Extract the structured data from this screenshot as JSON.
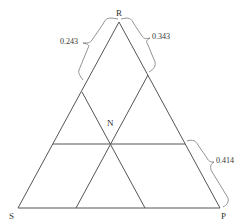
{
  "diagram": {
    "type": "ternary-triangle",
    "vertices": {
      "top": "R",
      "bottom_left": "S",
      "bottom_right": "P"
    },
    "interior_point": "N",
    "annotations": [
      {
        "id": "left-upper-brace",
        "value": "0.243",
        "side": "R-S",
        "segment": "upper"
      },
      {
        "id": "right-upper-brace",
        "value": "0.343",
        "side": "R-P",
        "segment": "upper"
      },
      {
        "id": "right-lower-brace",
        "value": "0.414",
        "side": "R-P",
        "segment": "lower"
      }
    ],
    "line_color": "#555555"
  }
}
